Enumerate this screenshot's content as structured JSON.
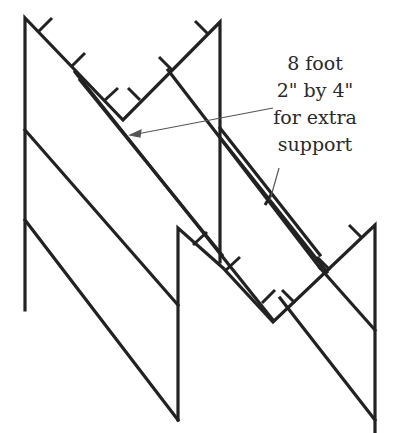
{
  "diagram": {
    "type": "isometric folding wall / zigzag panel frame",
    "stroke_color": "#222222",
    "annotation_color": "#444444",
    "background": "#ffffff"
  },
  "annotation": {
    "lines": [
      "8 foot",
      "2\" by 4\"",
      "for extra",
      "support"
    ]
  }
}
